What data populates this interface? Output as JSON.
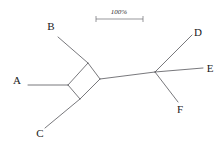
{
  "figure": {
    "type": "split-network",
    "background_color": "#ffffff",
    "line_color": "#55555a",
    "label_color": "#1a1a1a"
  },
  "scale_bar": {
    "label": "100%",
    "x_start": 96,
    "x_end": 143,
    "y": 19,
    "tick_height": 4,
    "label_x": 119,
    "label_y": 14
  },
  "taxa": [
    {
      "id": "A",
      "label": "A",
      "label_x": 17,
      "label_y": 84,
      "tip_x": 28,
      "tip_y": 85
    },
    {
      "id": "B",
      "label": "B",
      "label_x": 51,
      "label_y": 30,
      "tip_x": 58,
      "tip_y": 37
    },
    {
      "id": "C",
      "label": "C",
      "label_x": 40,
      "label_y": 137,
      "tip_x": 45,
      "tip_y": 128
    },
    {
      "id": "D",
      "label": "D",
      "label_x": 198,
      "label_y": 36,
      "tip_x": 192,
      "tip_y": 35
    },
    {
      "id": "E",
      "label": "E",
      "label_x": 210,
      "label_y": 72,
      "tip_x": 203,
      "tip_y": 68
    },
    {
      "id": "F",
      "label": "F",
      "label_x": 180,
      "label_y": 113,
      "tip_x": 178,
      "tip_y": 102
    }
  ],
  "nodes": {
    "box_left": {
      "x": 68,
      "y": 85
    },
    "box_top": {
      "x": 88,
      "y": 63
    },
    "box_right": {
      "x": 100,
      "y": 79
    },
    "box_bottom": {
      "x": 80,
      "y": 99
    },
    "right_hub": {
      "x": 155,
      "y": 72
    }
  },
  "edges": [
    {
      "name": "edge-A",
      "from": [
        28,
        85
      ],
      "to": [
        68,
        85
      ]
    },
    {
      "name": "edge-B",
      "from": [
        58,
        37
      ],
      "to": [
        88,
        63
      ]
    },
    {
      "name": "edge-C",
      "from": [
        45,
        128
      ],
      "to": [
        80,
        99
      ]
    },
    {
      "name": "edge-internal",
      "from": [
        100,
        79
      ],
      "to": [
        155,
        72
      ]
    },
    {
      "name": "edge-D",
      "from": [
        155,
        72
      ],
      "to": [
        192,
        35
      ]
    },
    {
      "name": "edge-E",
      "from": [
        155,
        72
      ],
      "to": [
        203,
        68
      ]
    },
    {
      "name": "edge-F",
      "from": [
        155,
        72
      ],
      "to": [
        178,
        102
      ]
    }
  ],
  "box_edges": [
    {
      "name": "box-edge-left-top",
      "from": [
        68,
        85
      ],
      "to": [
        88,
        63
      ]
    },
    {
      "name": "box-edge-top-right",
      "from": [
        88,
        63
      ],
      "to": [
        100,
        79
      ]
    },
    {
      "name": "box-edge-right-bottom",
      "from": [
        100,
        79
      ],
      "to": [
        80,
        99
      ]
    },
    {
      "name": "box-edge-bottom-left",
      "from": [
        80,
        99
      ],
      "to": [
        68,
        85
      ]
    }
  ]
}
